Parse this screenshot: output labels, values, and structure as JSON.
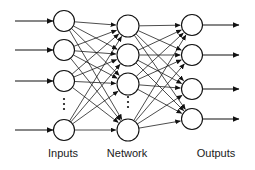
{
  "figure": {
    "background_color": "#ffffff",
    "stroke_color": "#111111",
    "text_color": "#1a1a1a",
    "width": 255,
    "height": 170
  },
  "captions": [
    {
      "id": "inputs",
      "label": "Inputs",
      "x": 63,
      "y": 157
    },
    {
      "id": "network",
      "label": "Network",
      "x": 127,
      "y": 157
    },
    {
      "id": "outputs",
      "label": "Outputs",
      "x": 216,
      "y": 157
    }
  ],
  "chart_data": {
    "type": "diagram",
    "layers": [
      {
        "name": "Inputs",
        "caption": "Inputs",
        "x": 64,
        "node_radius": 10.5,
        "node_count_visible": 4,
        "has_ellipsis": true,
        "ellipsis_between_nodes": [
          3,
          4
        ],
        "nodes_y": [
          21,
          50,
          81,
          130
        ]
      },
      {
        "name": "Network",
        "caption": "Network",
        "x": 128,
        "node_radius": 11,
        "node_count_visible": 4,
        "has_ellipsis": true,
        "ellipsis_between_nodes": [
          3,
          4
        ],
        "nodes_y": [
          26,
          55,
          84,
          130
        ]
      },
      {
        "name": "Outputs",
        "caption": "Outputs",
        "x": 192,
        "node_radius": 10.5,
        "node_count_visible": 4,
        "has_ellipsis": false,
        "ellipsis_between_nodes": [],
        "nodes_y": [
          25,
          55,
          89,
          119
        ]
      }
    ],
    "connections": [
      {
        "from_layer": 0,
        "to_layer": 1,
        "pattern": "fully-connected",
        "arrowheads": true
      },
      {
        "from_layer": 1,
        "to_layer": 2,
        "pattern": "fully-connected",
        "arrowheads": true
      }
    ],
    "input_arrows": {
      "count": 4,
      "x_start": 15,
      "x_end": 53,
      "arrowheads": true,
      "ys": [
        21,
        50,
        81,
        130
      ]
    },
    "output_arrows": {
      "count": 4,
      "x_start": 203,
      "x_end": 239,
      "arrowheads": true,
      "ys": [
        25,
        55,
        89,
        119
      ]
    },
    "ellipsis": [
      {
        "layer": 0,
        "x": 64,
        "ys": [
          99,
          104,
          109
        ],
        "radius": 1.1
      },
      {
        "layer": 1,
        "x": 128,
        "ys": [
          97,
          102,
          107
        ],
        "radius": 1.1
      }
    ]
  }
}
